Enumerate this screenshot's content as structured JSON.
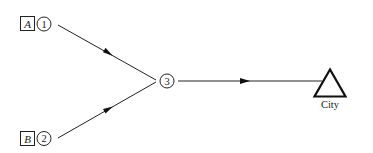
{
  "diagram": {
    "type": "network-flow",
    "colors": {
      "stroke": "#222222",
      "background": "#ffffff"
    },
    "sources": [
      {
        "id": "A",
        "label": "A",
        "node": "1"
      },
      {
        "id": "B",
        "label": "B",
        "node": "2"
      }
    ],
    "nodes": [
      {
        "id": "1",
        "label": "1"
      },
      {
        "id": "2",
        "label": "2"
      },
      {
        "id": "3",
        "label": "3"
      }
    ],
    "sink": {
      "id": "city",
      "label": "City",
      "shape": "triangle"
    },
    "edges": [
      {
        "from": "1",
        "to": "3",
        "directed": true
      },
      {
        "from": "2",
        "to": "3",
        "directed": true
      },
      {
        "from": "3",
        "to": "city",
        "directed": true
      }
    ]
  }
}
